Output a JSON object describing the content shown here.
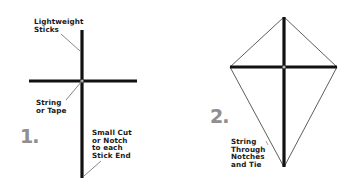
{
  "diagram": {
    "colors": {
      "stick": "#111111",
      "string": "#555555",
      "step_number": "#8f8f8f",
      "text": "#1a1a1a"
    },
    "step1": {
      "number": "1.",
      "labels": {
        "sticks": "Lightweight\nSticks",
        "joint": "String\nor Tape",
        "notch": "Small Cut\nor Notch\nto each\nStick End"
      }
    },
    "step2": {
      "number": "2.",
      "labels": {
        "string": "String\nThrough\nNotches\nand Tie"
      }
    }
  }
}
